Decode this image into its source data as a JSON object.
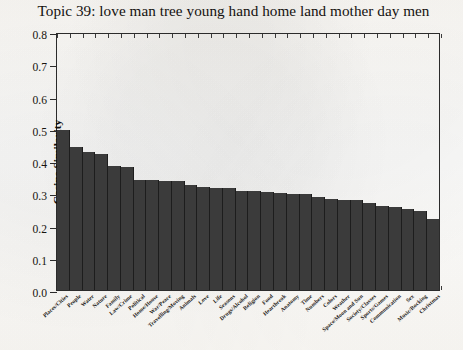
{
  "figure": {
    "title": "Topic 39: love man tree young hand home land mother day men",
    "background_color": "#fdfdfb",
    "bar_color": "#3b3b3b",
    "axis_color": "#2b2b2b"
  },
  "chart_data": {
    "type": "bar",
    "title": "Topic 39: love man tree young hand home land mother day men",
    "xlabel": "",
    "ylabel": "Cosine Similarity",
    "ylim": [
      0.0,
      0.8
    ],
    "ytick_labels": [
      "0.0",
      "0.1",
      "0.2",
      "0.3",
      "0.4",
      "0.5",
      "0.6",
      "0.7",
      "0.8"
    ],
    "ytick_values": [
      0.0,
      0.1,
      0.2,
      0.3,
      0.4,
      0.5,
      0.6,
      0.7,
      0.8
    ],
    "grid": false,
    "legend": "none",
    "orientation": "vertical",
    "sorted": "descending",
    "categories": [
      "Places/Cities",
      "People",
      "Water",
      "Nature",
      "Family",
      "Law/Crime",
      "Political",
      "Home/House",
      "War/Peace",
      "Travelling/Moving",
      "Animals",
      "Love",
      "Life",
      "Seasons",
      "Drugs/Alcohol",
      "Religion",
      "Food",
      "Heartbreak",
      "Anatomy",
      "Time",
      "Numbers",
      "Colors",
      "Weather",
      "Space/Moon and Sun",
      "Society/Classes",
      "Sports/Games",
      "Communication",
      "Sex",
      "Music/Rocking",
      "Christmas"
    ],
    "values": [
      0.5,
      0.447,
      0.43,
      0.425,
      0.388,
      0.385,
      0.345,
      0.344,
      0.342,
      0.341,
      0.327,
      0.322,
      0.32,
      0.318,
      0.31,
      0.308,
      0.305,
      0.302,
      0.3,
      0.299,
      0.292,
      0.285,
      0.282,
      0.28,
      0.272,
      0.263,
      0.258,
      0.252,
      0.248,
      0.223
    ]
  }
}
